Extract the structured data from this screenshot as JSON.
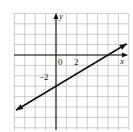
{
  "chart_data": {
    "type": "line",
    "title": "",
    "xlabel": "x",
    "ylabel": "y",
    "grid": true,
    "xlim": [
      -4,
      7
    ],
    "ylim": [
      -7,
      4
    ],
    "x_tick_labels": [
      {
        "value": 0,
        "label": "0"
      },
      {
        "value": 2,
        "label": "2"
      }
    ],
    "y_tick_labels": [
      {
        "value": -2,
        "label": "−2"
      }
    ],
    "series": [
      {
        "name": "line",
        "equation": "y = (3/5)x - 3",
        "slope": 0.6,
        "intercept": -3,
        "x": [
          -3.85,
          0,
          5,
          6.8
        ],
        "y": [
          -5.31,
          -3,
          0,
          1.08
        ],
        "arrows": "both ends"
      }
    ]
  },
  "labels": {
    "x_axis": "x",
    "y_axis": "y",
    "origin": "0",
    "x_tick_2": "2",
    "y_tick_neg2": "−2"
  }
}
